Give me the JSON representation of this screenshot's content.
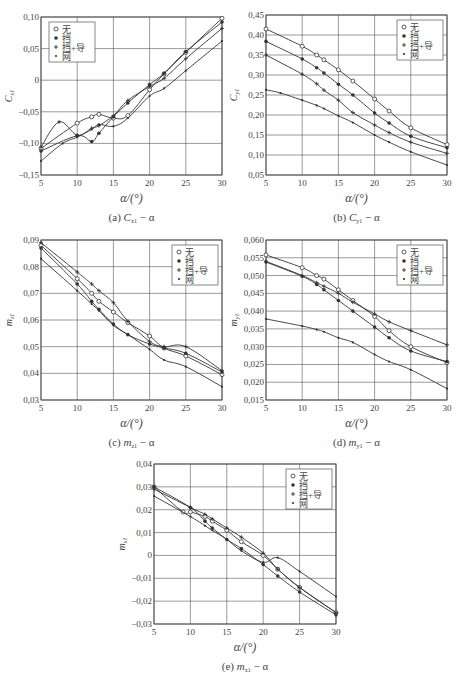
{
  "chart_data": [
    {
      "id": "a",
      "type": "line",
      "caption": "(a) Cx1 − α",
      "caption_main": "(a) ",
      "caption_sym": "C",
      "caption_sub": "x1",
      "caption_tail": " − α",
      "xlabel": "α/(°)",
      "ylabel": "C",
      "ylabel_sub": "x1",
      "xlim": [
        5,
        30
      ],
      "ylim": [
        -0.15,
        0.1
      ],
      "xticks": [
        5,
        10,
        15,
        20,
        25,
        30
      ],
      "xtick_labels": [
        "5",
        "10",
        "15",
        "20",
        "25",
        "30"
      ],
      "yticks": [
        -0.15,
        -0.1,
        -0.05,
        0,
        0.05,
        0.1
      ],
      "ytick_labels": [
        "−0,15",
        "−0,10",
        "−0,05",
        "0",
        "0,05",
        "0,10"
      ],
      "grid": true,
      "legend_position": "upper-left",
      "legend": [
        "无",
        "挡",
        "挡+导",
        "网"
      ],
      "box": {
        "x": 41,
        "y": 17,
        "w": 181,
        "h": 158
      },
      "series": [
        {
          "name": "无",
          "marker": "circle-open",
          "x": [
            5,
            10,
            12,
            13,
            15,
            17,
            20,
            22,
            25,
            30
          ],
          "y": [
            -0.108,
            -0.068,
            -0.058,
            -0.054,
            -0.06,
            -0.056,
            -0.015,
            0.01,
            0.044,
            0.098
          ]
        },
        {
          "name": "挡",
          "marker": "dot",
          "x": [
            5,
            10,
            12,
            13,
            15,
            17,
            20,
            22,
            25,
            30
          ],
          "y": [
            -0.112,
            -0.088,
            -0.097,
            -0.084,
            -0.058,
            -0.036,
            -0.007,
            0.011,
            0.045,
            0.092
          ]
        },
        {
          "name": "挡+导",
          "marker": "plus",
          "x": [
            5,
            7.5,
            10,
            12,
            13,
            15,
            17,
            20,
            22,
            25,
            30
          ],
          "y": [
            -0.106,
            -0.066,
            -0.087,
            -0.076,
            -0.072,
            -0.056,
            -0.032,
            -0.01,
            0.003,
            0.034,
            0.082
          ]
        },
        {
          "name": "网",
          "marker": "small-dot",
          "x": [
            5,
            8,
            10,
            12,
            13,
            15,
            17,
            20,
            22,
            25,
            30
          ],
          "y": [
            -0.128,
            -0.1,
            -0.09,
            -0.078,
            -0.07,
            -0.073,
            -0.06,
            -0.025,
            -0.013,
            0.015,
            0.062
          ]
        }
      ]
    },
    {
      "id": "b",
      "type": "line",
      "caption_main": "(b) ",
      "caption_sym": "C",
      "caption_sub": "y1",
      "caption_tail": " − α",
      "xlabel": "α/(°)",
      "ylabel": "C",
      "ylabel_sub": "y1",
      "xlim": [
        5,
        30
      ],
      "ylim": [
        0.05,
        0.45
      ],
      "xticks": [
        5,
        10,
        15,
        20,
        25,
        30
      ],
      "xtick_labels": [
        "5",
        "10",
        "15",
        "20",
        "25",
        "30"
      ],
      "yticks": [
        0.05,
        0.1,
        0.15,
        0.2,
        0.25,
        0.3,
        0.35,
        0.4,
        0.45
      ],
      "ytick_labels": [
        "0,05",
        "0,10",
        "0,15",
        "0,20",
        "0,25",
        "0,30",
        "0,35",
        "0,40",
        "0,45"
      ],
      "grid": true,
      "legend_position": "upper-right",
      "legend": [
        "无",
        "挡",
        "挡+导",
        "网"
      ],
      "box": {
        "x": 266,
        "y": 15,
        "w": 181,
        "h": 160
      },
      "series": [
        {
          "name": "无",
          "marker": "circle-open",
          "x": [
            5,
            10,
            12,
            13,
            15,
            17,
            20,
            22,
            25,
            30
          ],
          "y": [
            0.415,
            0.372,
            0.35,
            0.338,
            0.313,
            0.285,
            0.24,
            0.21,
            0.168,
            0.126
          ]
        },
        {
          "name": "挡",
          "marker": "dot",
          "x": [
            5,
            10,
            12,
            13,
            15,
            17,
            20,
            22,
            25,
            30
          ],
          "y": [
            0.384,
            0.34,
            0.318,
            0.305,
            0.277,
            0.25,
            0.205,
            0.18,
            0.147,
            0.118
          ]
        },
        {
          "name": "挡+导",
          "marker": "plus",
          "x": [
            5,
            10,
            12,
            13,
            15,
            17,
            20,
            22,
            25,
            30
          ],
          "y": [
            0.35,
            0.302,
            0.278,
            0.262,
            0.237,
            0.206,
            0.175,
            0.156,
            0.132,
            0.104
          ]
        },
        {
          "name": "网",
          "marker": "small-dot",
          "x": [
            5,
            7,
            10,
            12,
            13,
            15,
            17,
            20,
            22,
            25,
            30
          ],
          "y": [
            0.263,
            0.255,
            0.237,
            0.224,
            0.216,
            0.198,
            0.181,
            0.15,
            0.132,
            0.108,
            0.075
          ]
        }
      ]
    },
    {
      "id": "c",
      "type": "line",
      "caption_main": "(c) ",
      "caption_sym": "m",
      "caption_sub": "z1",
      "caption_tail": " − α",
      "xlabel": "α/(°)",
      "ylabel": "m",
      "ylabel_sub": "z1",
      "xlim": [
        5,
        30
      ],
      "ylim": [
        0.03,
        0.09
      ],
      "xticks": [
        5,
        10,
        15,
        20,
        25,
        30
      ],
      "xtick_labels": [
        "5",
        "10",
        "15",
        "20",
        "25",
        "30"
      ],
      "yticks": [
        0.03,
        0.04,
        0.05,
        0.06,
        0.07,
        0.08,
        0.09
      ],
      "ytick_labels": [
        "0,03",
        "0,04",
        "0,05",
        "0,06",
        "0,07",
        "0,08",
        "0,09"
      ],
      "grid": true,
      "legend_position": "upper-right",
      "legend": [
        "无",
        "挡",
        "挡+导",
        "网"
      ],
      "box": {
        "x": 41,
        "y": 240,
        "w": 181,
        "h": 160
      },
      "series": [
        {
          "name": "无",
          "marker": "circle-open",
          "x": [
            5,
            10,
            12,
            13,
            15,
            17,
            20,
            22,
            25,
            30
          ],
          "y": [
            0.088,
            0.0755,
            0.07,
            0.067,
            0.063,
            0.059,
            0.054,
            0.0495,
            0.0465,
            0.0395
          ]
        },
        {
          "name": "挡",
          "marker": "dot",
          "x": [
            5,
            10,
            12,
            13,
            15,
            17,
            20,
            22,
            25,
            30
          ],
          "y": [
            0.087,
            0.0735,
            0.067,
            0.064,
            0.0585,
            0.0545,
            0.051,
            0.0495,
            0.0475,
            0.0405
          ]
        },
        {
          "name": "挡+导",
          "marker": "plus",
          "x": [
            5,
            10,
            12,
            13,
            15,
            17,
            20,
            22,
            25,
            30
          ],
          "y": [
            0.089,
            0.078,
            0.0735,
            0.071,
            0.0665,
            0.0595,
            0.052,
            0.05,
            0.05,
            0.041
          ]
        },
        {
          "name": "网",
          "marker": "small-dot",
          "x": [
            5,
            10,
            12,
            13,
            15,
            17,
            20,
            22,
            25,
            30
          ],
          "y": [
            0.083,
            0.071,
            0.066,
            0.0635,
            0.058,
            0.0545,
            0.049,
            0.045,
            0.0425,
            0.035
          ]
        }
      ]
    },
    {
      "id": "d",
      "type": "line",
      "caption_main": "(d) ",
      "caption_sym": "m",
      "caption_sub": "y1",
      "caption_tail": " − α",
      "xlabel": "α/(°)",
      "ylabel": "m",
      "ylabel_sub": "y1",
      "xlim": [
        5,
        30
      ],
      "ylim": [
        0.015,
        0.06
      ],
      "xticks": [
        5,
        10,
        15,
        20,
        25,
        30
      ],
      "xtick_labels": [
        "5",
        "10",
        "15",
        "20",
        "25",
        "30"
      ],
      "yticks": [
        0.015,
        0.02,
        0.025,
        0.03,
        0.035,
        0.04,
        0.045,
        0.05,
        0.055,
        0.06
      ],
      "ytick_labels": [
        "0,015",
        "0,020",
        "0,025",
        "0,030",
        "0,035",
        "0,040",
        "0,045",
        "0,050",
        "0,055",
        "0,060"
      ],
      "grid": true,
      "legend_position": "upper-right",
      "legend": [
        "无",
        "挡",
        "挡+导",
        "网"
      ],
      "box": {
        "x": 266,
        "y": 240,
        "w": 181,
        "h": 160
      },
      "series": [
        {
          "name": "无",
          "marker": "circle-open",
          "x": [
            5,
            10,
            12,
            13,
            15,
            17,
            20,
            22,
            25,
            30
          ],
          "y": [
            0.0558,
            0.0522,
            0.05,
            0.049,
            0.046,
            0.043,
            0.0385,
            0.0345,
            0.03,
            0.0255
          ]
        },
        {
          "name": "挡",
          "marker": "dot",
          "x": [
            5,
            10,
            12,
            13,
            15,
            17,
            20,
            22,
            25,
            30
          ],
          "y": [
            0.0538,
            0.0498,
            0.0475,
            0.046,
            0.043,
            0.04,
            0.0355,
            0.0325,
            0.0288,
            0.0258
          ]
        },
        {
          "name": "挡+导",
          "marker": "plus",
          "x": [
            5,
            10,
            12,
            13,
            15,
            17,
            20,
            22,
            25,
            30
          ],
          "y": [
            0.054,
            0.05,
            0.048,
            0.047,
            0.045,
            0.0425,
            0.0392,
            0.037,
            0.0345,
            0.0305
          ]
        },
        {
          "name": "网",
          "marker": "small-dot",
          "x": [
            5,
            10,
            12,
            13,
            15,
            17,
            20,
            22,
            25,
            30
          ],
          "y": [
            0.0378,
            0.0358,
            0.0348,
            0.0342,
            0.0325,
            0.0312,
            0.0278,
            0.0258,
            0.0235,
            0.0182
          ]
        }
      ]
    },
    {
      "id": "e",
      "type": "line",
      "caption_main": "(e) ",
      "caption_sym": "m",
      "caption_sub": "x1",
      "caption_tail": " − α",
      "xlabel": "α/(°)",
      "ylabel": "m",
      "ylabel_sub": "x1",
      "xlim": [
        5,
        30
      ],
      "ylim": [
        -0.03,
        0.04
      ],
      "xticks": [
        5,
        10,
        15,
        20,
        25,
        30
      ],
      "xtick_labels": [
        "5",
        "10",
        "15",
        "20",
        "25",
        "30"
      ],
      "yticks": [
        -0.03,
        -0.02,
        -0.01,
        0,
        0.01,
        0.02,
        0.03,
        0.04
      ],
      "ytick_labels": [
        "−0,03",
        "−0,02",
        "−0,01",
        "0",
        "0,01",
        "0,02",
        "0,03",
        "0,04"
      ],
      "grid": true,
      "legend_position": "upper-right",
      "legend": [
        "无",
        "挡",
        "挡+导",
        "网"
      ],
      "box": {
        "x": 154,
        "y": 464,
        "w": 182,
        "h": 160
      },
      "series": [
        {
          "name": "无",
          "marker": "circle-open",
          "x": [
            5,
            9,
            10,
            12,
            13,
            15,
            17,
            20,
            22,
            25,
            30
          ],
          "y": [
            0.03,
            0.019,
            0.019,
            0.017,
            0.015,
            0.011,
            0.006,
            0.0,
            -0.006,
            -0.014,
            -0.025
          ]
        },
        {
          "name": "挡",
          "marker": "dot",
          "x": [
            5,
            10,
            12,
            13,
            15,
            17,
            20,
            22,
            25,
            30
          ],
          "y": [
            0.03,
            0.021,
            0.015,
            0.012,
            0.007,
            0.003,
            -0.004,
            -0.009,
            -0.016,
            -0.026
          ]
        },
        {
          "name": "挡+导",
          "marker": "plus",
          "x": [
            5,
            10,
            12,
            13,
            15,
            17,
            20,
            22,
            25,
            30
          ],
          "y": [
            0.029,
            0.021,
            0.018,
            0.016,
            0.012,
            0.008,
            0.001,
            -0.006,
            -0.014,
            -0.025
          ]
        },
        {
          "name": "网",
          "marker": "small-dot",
          "x": [
            5,
            10,
            12,
            13,
            15,
            17,
            20,
            22,
            25,
            30
          ],
          "y": [
            0.026,
            0.017,
            0.013,
            0.011,
            0.007,
            0.002,
            -0.003,
            -0.001,
            -0.007,
            -0.018
          ]
        }
      ]
    }
  ]
}
